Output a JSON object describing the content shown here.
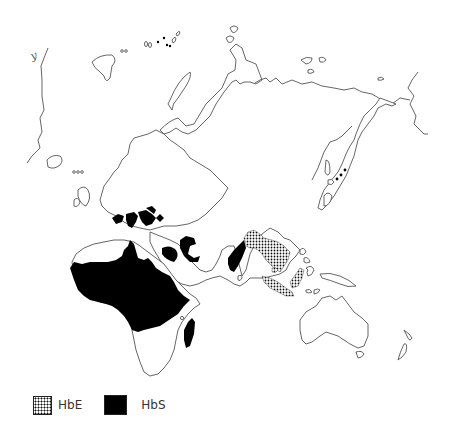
{
  "map": {
    "title": "",
    "region": "Europe, Africa, Asia and Oceania (Old World)",
    "projection_marker": "y",
    "regions": [
      {
        "name": "HbS-sub-saharan-africa",
        "variant": "HbS"
      },
      {
        "name": "HbS-mediterranean",
        "variant": "HbS"
      },
      {
        "name": "HbS-arabian-peninsula",
        "variant": "HbS"
      },
      {
        "name": "HbS-india",
        "variant": "HbS"
      },
      {
        "name": "HbS-madagascar",
        "variant": "HbS"
      },
      {
        "name": "HbE-southeast-asia",
        "variant": "HbE"
      },
      {
        "name": "HbE-indonesia",
        "variant": "HbE"
      }
    ]
  },
  "legend": {
    "items": [
      {
        "label": "HbE",
        "pattern": "dotted",
        "color": "#000000"
      },
      {
        "label": "HbS",
        "pattern": "solid",
        "color": "#000000"
      }
    ]
  },
  "colors": {
    "background": "#ffffff",
    "coastline": "#555555",
    "hbs_fill": "#000000",
    "hbe_fill": "dotted-black"
  }
}
